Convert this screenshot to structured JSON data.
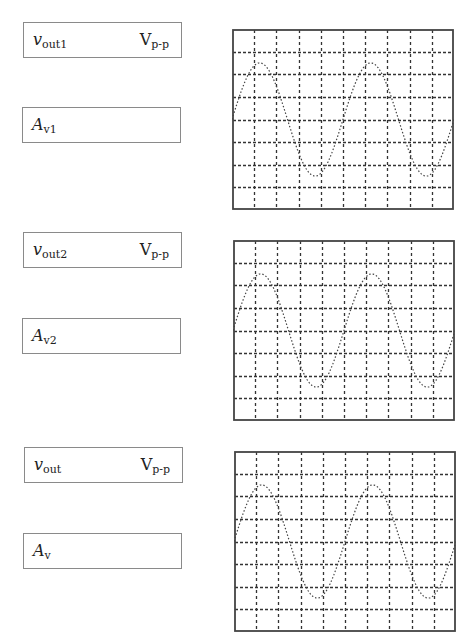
{
  "panels": [
    {
      "id": "stage1",
      "vout_box": {
        "var": "v",
        "sub": "out1",
        "unit": "V",
        "unit_sub": "p-p",
        "value": ""
      },
      "gain_box": {
        "var": "A",
        "sub": "v1",
        "value": ""
      },
      "scope": {
        "x": 232,
        "y": 29
      }
    },
    {
      "id": "stage2",
      "vout_box": {
        "var": "v",
        "sub": "out2",
        "unit": "V",
        "unit_sub": "p-p",
        "value": ""
      },
      "gain_box": {
        "var": "A",
        "sub": "v2",
        "value": ""
      },
      "scope": {
        "x": 233,
        "y": 240
      }
    },
    {
      "id": "overall",
      "vout_box": {
        "var": "v",
        "sub": "out",
        "unit": "V",
        "unit_sub": "p-p",
        "value": ""
      },
      "gain_box": {
        "var": "A",
        "sub": "v",
        "value": ""
      },
      "scope": {
        "x": 234,
        "y": 451
      }
    }
  ],
  "scope_grid": {
    "h_divisions": 10,
    "v_divisions": 8,
    "grid_color": "#333333",
    "border_color": "#444444",
    "trace_color": "#444444"
  },
  "waveform": {
    "shape": "sine",
    "amplitude_div": 2.5,
    "period_div": 5,
    "cycles_shown": 2,
    "start_phase_deg": 0
  }
}
